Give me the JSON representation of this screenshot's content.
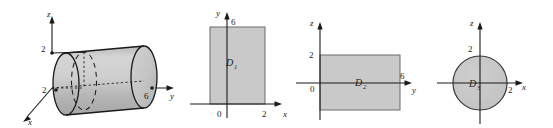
{
  "figure": {
    "background": "#ffffff",
    "region_fill": "#c9c9c9",
    "stroke": "#1a1a1a"
  },
  "panels": [
    {
      "id": "panel-solid",
      "kind": "3d-cylinder",
      "axes": [
        {
          "name": "z",
          "label": "z"
        },
        {
          "name": "y",
          "label": "y"
        },
        {
          "name": "x",
          "label": "x"
        }
      ],
      "ticks": [
        {
          "axis": "z",
          "label": "2"
        },
        {
          "axis": "x",
          "label": "2"
        },
        {
          "axis": "y",
          "label": "6"
        }
      ]
    },
    {
      "id": "panel-d1",
      "kind": "2d-rectangle",
      "region_label": "D",
      "region_sub": "1",
      "axes": [
        {
          "name": "y",
          "label": "y"
        },
        {
          "name": "x",
          "label": "x"
        }
      ],
      "ticks": [
        {
          "axis": "y",
          "label": "6"
        },
        {
          "axis": "origin",
          "label": "0"
        },
        {
          "axis": "x",
          "label": "2"
        }
      ]
    },
    {
      "id": "panel-d2",
      "kind": "2d-rectangle",
      "region_label": "D",
      "region_sub": "2",
      "axes": [
        {
          "name": "z",
          "label": "z"
        },
        {
          "name": "y",
          "label": "y"
        }
      ],
      "ticks": [
        {
          "axis": "z",
          "label": "2"
        },
        {
          "axis": "origin",
          "label": "0"
        },
        {
          "axis": "y",
          "label": "6"
        }
      ]
    },
    {
      "id": "panel-d3",
      "kind": "2d-disk",
      "region_label": "D",
      "region_sub": "3",
      "axes": [
        {
          "name": "z",
          "label": "z"
        },
        {
          "name": "x",
          "label": "x"
        }
      ],
      "ticks": [
        {
          "axis": "z",
          "label": "2"
        },
        {
          "axis": "x",
          "label": "2"
        }
      ]
    }
  ]
}
